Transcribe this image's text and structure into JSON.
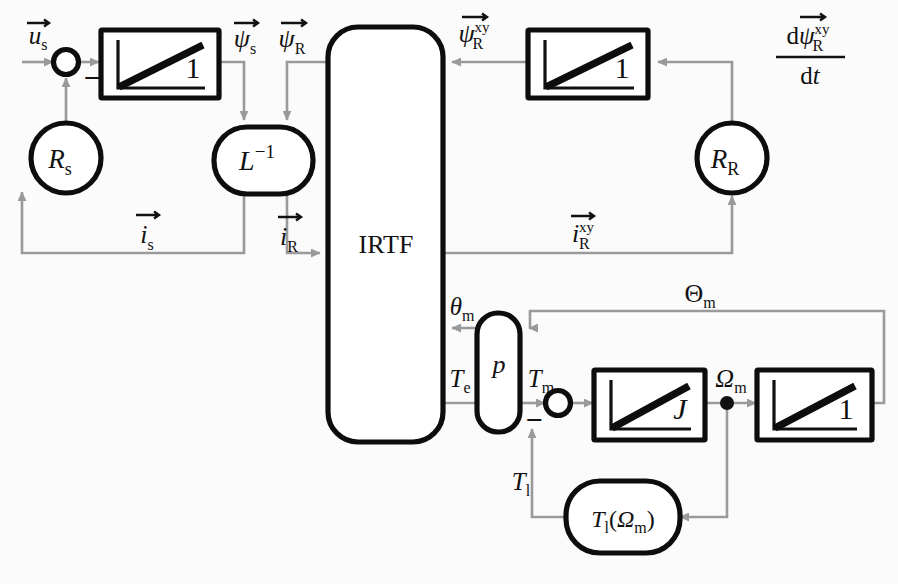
{
  "diagram": {
    "colors": {
      "wire": "#9a9a9a",
      "block_stroke": "#0d0d0d",
      "background": "#fbfbfb",
      "text": "#111111"
    },
    "blocks": [
      {
        "id": "sum_us",
        "name": "summing-junction-stator",
        "shape": "circle-sum",
        "label": "",
        "sign": "−"
      },
      {
        "id": "int_psis",
        "name": "integrator-stator-flux",
        "shape": "ramp-box",
        "label": "1"
      },
      {
        "id": "Rs",
        "name": "stator-resistance",
        "shape": "circle",
        "label": "Rₛ"
      },
      {
        "id": "Linv",
        "name": "inverse-inductance",
        "shape": "stadium",
        "label": "L⁻¹"
      },
      {
        "id": "IRTF",
        "name": "irtf-block",
        "shape": "tall-round",
        "label": "IRTF"
      },
      {
        "id": "int_psiRxy",
        "name": "integrator-rotor-flux",
        "shape": "ramp-box",
        "label": "1"
      },
      {
        "id": "RR",
        "name": "rotor-resistance",
        "shape": "circle",
        "label": "Rʀ"
      },
      {
        "id": "p_block",
        "name": "pole-pair-block",
        "shape": "stadium-v",
        "label": "p"
      },
      {
        "id": "sum_Tm",
        "name": "summing-junction-torque",
        "shape": "circle-sum",
        "label": "",
        "sign": "−"
      },
      {
        "id": "int_J",
        "name": "integrator-inertia",
        "shape": "ramp-box",
        "label": "J"
      },
      {
        "id": "int_theta",
        "name": "integrator-angle",
        "shape": "ramp-box",
        "label": "1"
      },
      {
        "id": "Tl_block",
        "name": "load-torque-block",
        "shape": "stadium",
        "label": "Tₗ(Ωₘ)"
      }
    ],
    "signals": [
      {
        "id": "us",
        "name": "stator-voltage-label",
        "latex": "u_s",
        "text": "u⃗ₛ"
      },
      {
        "id": "psis",
        "name": "stator-flux-label",
        "latex": "psi_s",
        "text": "ψ⃗ₛ"
      },
      {
        "id": "psiR",
        "name": "rotor-flux-label",
        "latex": "psi_R",
        "text": "ψ⃗ʀ"
      },
      {
        "id": "psiRxy",
        "name": "rotor-flux-xy-label",
        "latex": "psi_R^{xy}",
        "text": "ψ⃗ʀ^xy"
      },
      {
        "id": "dpsiRxy",
        "name": "rotor-flux-derivative-label",
        "latex": "dpsi_R^{xy}/dt",
        "text": "dψ⃗ʀ^xy / dt"
      },
      {
        "id": "is",
        "name": "stator-current-label",
        "latex": "i_s",
        "text": "i⃗ₛ"
      },
      {
        "id": "iR",
        "name": "rotor-current-label",
        "latex": "i_R",
        "text": "i⃗ʀ"
      },
      {
        "id": "iRxy",
        "name": "rotor-current-xy-label",
        "latex": "i_R^{xy}",
        "text": "i⃗ʀ^xy"
      },
      {
        "id": "thetam",
        "name": "rotor-angle-small-label",
        "latex": "theta_m",
        "text": "θₘ"
      },
      {
        "id": "Thetam",
        "name": "rotor-angle-capital-label",
        "latex": "Theta_m",
        "text": "Θₘ"
      },
      {
        "id": "Te",
        "name": "electrical-torque-label",
        "latex": "T_e",
        "text": "Tₑ"
      },
      {
        "id": "Tm",
        "name": "mechanical-torque-label",
        "latex": "T_m",
        "text": "Tₘ"
      },
      {
        "id": "Tl",
        "name": "load-torque-label",
        "latex": "T_l",
        "text": "Tₗ"
      },
      {
        "id": "Omegam",
        "name": "rotor-speed-label",
        "latex": "Omega_m",
        "text": "Ωₘ"
      }
    ],
    "text": {
      "irtf": "IRTF",
      "gain_one": "1",
      "gain_J": "J",
      "p": "p",
      "Linv_base": "L",
      "Linv_exp": "−1",
      "Rs_base": "R",
      "Rs_sub": "s",
      "RR_base": "R",
      "RR_sub": "R",
      "minus": "−",
      "Tl_func_base": "T",
      "Tl_func_sub": "l",
      "Tl_func_arg_open": "(",
      "Tl_func_omega": "Ω",
      "Tl_func_omega_sub": "m",
      "Tl_func_arg_close": ")",
      "u_base": "u",
      "psi_base": "ψ",
      "i_base": "i",
      "theta_base": "θ",
      "Theta_base": "Θ",
      "Omega_base": "Ω",
      "T_base": "T",
      "sub_s": "s",
      "sub_R": "R",
      "sub_m": "m",
      "sub_e": "e",
      "sub_l": "l",
      "sup_xy": "xy",
      "d_roman": "d",
      "dt_roman": "d",
      "t_italic": "t"
    }
  }
}
